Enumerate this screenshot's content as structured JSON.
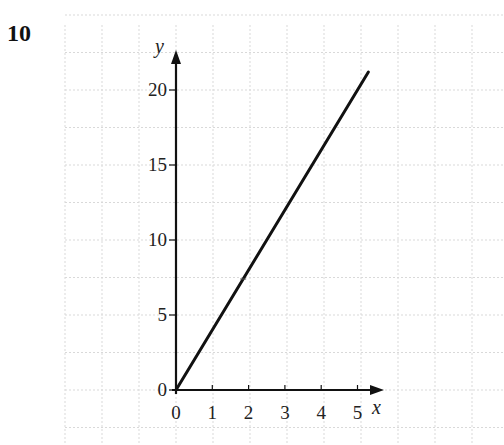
{
  "question_number": "10",
  "chart_data": {
    "type": "line",
    "title": "",
    "xlabel": "x",
    "ylabel": "y",
    "xlim": [
      0,
      5.3
    ],
    "ylim": [
      0,
      21.2
    ],
    "x_ticks": [
      "0",
      "1",
      "2",
      "3",
      "4",
      "5"
    ],
    "y_ticks": [
      "0",
      "5",
      "10",
      "15",
      "20"
    ],
    "grid": true,
    "legend": null,
    "series": [
      {
        "name": "line",
        "equation": "y = 4x",
        "x": [
          0,
          5.3
        ],
        "y": [
          0,
          21.2
        ],
        "marked_point": {
          "x": 1.85,
          "y": 7.4
        }
      }
    ]
  },
  "colors": {
    "line": "#111111",
    "axis": "#111111",
    "grid": "#d9d9d9"
  }
}
